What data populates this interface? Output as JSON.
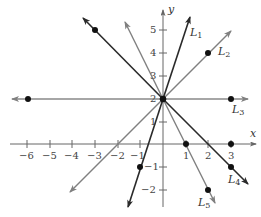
{
  "diagram": {
    "type": "coordinate-plane-lines",
    "axes": {
      "x_label": "x",
      "y_label": "y",
      "x_ticks": [
        -6,
        -5,
        -4,
        -3,
        -2,
        -1,
        1,
        2,
        3
      ],
      "y_ticks": [
        -2,
        -1,
        1,
        2,
        3,
        4,
        5
      ],
      "x_tick_labels": [
        "−6",
        "−5",
        "−4",
        "−3",
        "−2",
        "−1",
        "1",
        "2",
        "3"
      ],
      "y_tick_labels": [
        "−2",
        "−1",
        "1",
        "2",
        "3",
        "4",
        "5"
      ]
    },
    "common_point": {
      "x": 0,
      "y": 2
    },
    "lines": [
      {
        "name": "L1",
        "label_main": "L",
        "label_sub": "1",
        "slope": 3,
        "intercept": 2,
        "color": "#2a2a2a",
        "points": [
          [
            -1,
            -1
          ]
        ]
      },
      {
        "name": "L2",
        "label_main": "L",
        "label_sub": "2",
        "slope": 1,
        "intercept": 2,
        "color": "#777777",
        "points": [
          [
            2,
            4
          ]
        ]
      },
      {
        "name": "L3",
        "label_main": "L",
        "label_sub": "3",
        "slope": 0,
        "intercept": 2,
        "color": "#888888",
        "points": [
          [
            -6,
            2
          ],
          [
            3,
            2
          ]
        ]
      },
      {
        "name": "L4",
        "label_main": "L",
        "label_sub": "4",
        "slope": -1,
        "intercept": 2,
        "color": "#2a2a2a",
        "points": [
          [
            -3,
            5
          ],
          [
            3,
            -1
          ]
        ]
      },
      {
        "name": "L5",
        "label_main": "L",
        "label_sub": "5",
        "slope": -2,
        "intercept": 2,
        "color": "#777777",
        "points": [
          [
            1,
            0
          ],
          [
            2,
            -2
          ]
        ]
      }
    ],
    "extra_points": [
      [
        3,
        0
      ]
    ]
  }
}
